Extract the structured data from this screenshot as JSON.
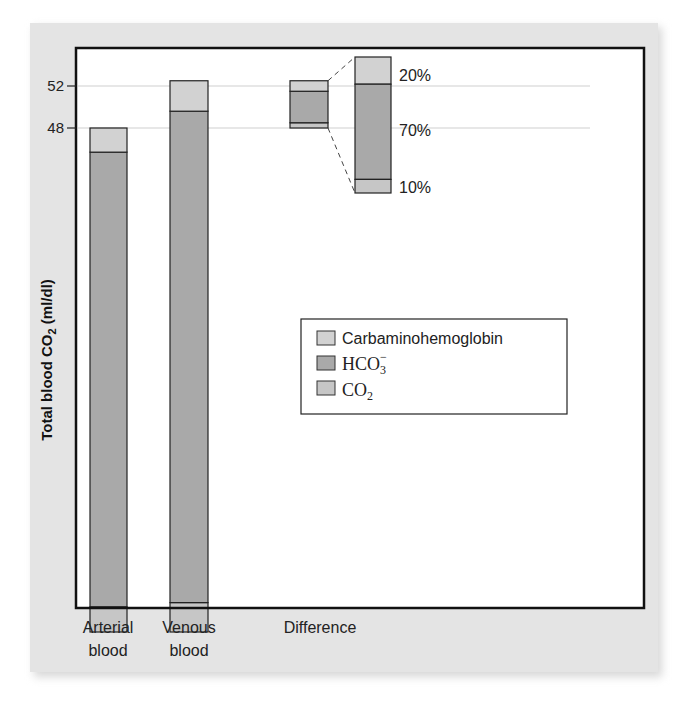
{
  "chart_data": {
    "type": "bar",
    "stacked": true,
    "title": "",
    "xlabel": "",
    "ylabel": "Total blood CO2 (ml/dl)",
    "ylabel_parts": {
      "main": "Total blood CO",
      "sub": "2",
      "unit": " (ml/dl)"
    },
    "ylim": [
      0,
      52
    ],
    "y_ticks": [
      48,
      52
    ],
    "gridlines": [
      48,
      52
    ],
    "categories": [
      "Arterial blood",
      "Venous blood",
      "Difference"
    ],
    "category_lines": [
      [
        "Arterial",
        "blood"
      ],
      [
        "Venous",
        "blood"
      ],
      [
        "Difference"
      ]
    ],
    "series": [
      {
        "name": "CO2",
        "key": "co2",
        "color": "#c6c6c6",
        "values": [
          2.4,
          2.8,
          0.5
        ]
      },
      {
        "name": "HCO3-",
        "key": "hco3",
        "color": "#a9a9a9",
        "values": [
          43.3,
          46.8,
          3.0
        ]
      },
      {
        "name": "Carbaminohemoglobin",
        "key": "carb",
        "color": "#d2d2d2",
        "values": [
          2.3,
          2.9,
          1.0
        ]
      }
    ],
    "difference_baseline": 48,
    "difference_breakdown": [
      {
        "name": "Carbaminohemoglobin",
        "percent": "20%",
        "fraction": 0.2
      },
      {
        "name": "HCO3-",
        "percent": "70%",
        "fraction": 0.7
      },
      {
        "name": "CO2",
        "percent": "10%",
        "fraction": 0.1
      }
    ],
    "legend": {
      "position": "center-right",
      "entries": [
        {
          "label": "Carbaminohemoglobin",
          "color": "#d2d2d2"
        },
        {
          "label_main": "HCO",
          "label_sub": "3",
          "label_sup": "−",
          "label": "HCO3-",
          "color": "#a9a9a9"
        },
        {
          "label_main": "CO",
          "label_sub": "2",
          "label": "CO2",
          "color": "#c6c6c6"
        }
      ]
    }
  }
}
